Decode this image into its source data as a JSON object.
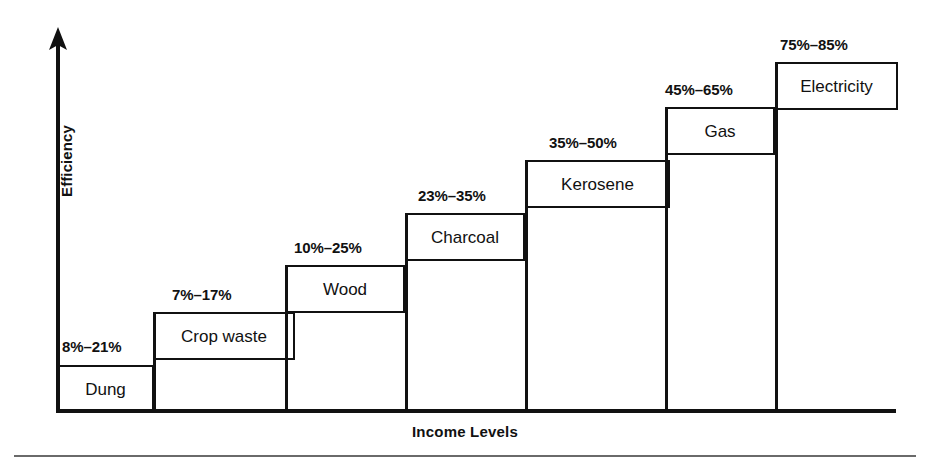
{
  "figure": {
    "y_axis_label": "Efficiency",
    "x_axis_label": "Income Levels"
  },
  "chart_data": {
    "type": "bar",
    "title": "",
    "xlabel": "Income Levels",
    "ylabel": "Efficiency",
    "subtitle": "",
    "grid": false,
    "legend": "none",
    "annotation_format": "low%-high%",
    "categories": [
      "Dung",
      "Crop waste",
      "Wood",
      "Charcoal",
      "Kerosene",
      "Gas",
      "Electricity"
    ],
    "range_labels": [
      "8%–21%",
      "7%–17%",
      "10%–25%",
      "23%–35%",
      "35%–50%",
      "45%–65%",
      "75%–85%"
    ],
    "low_values": [
      8,
      7,
      10,
      23,
      35,
      45,
      75
    ],
    "high_values": [
      21,
      17,
      25,
      35,
      50,
      65,
      85
    ],
    "series": [
      {
        "name": "Efficiency low (%)",
        "values": [
          8,
          7,
          10,
          23,
          35,
          45,
          75
        ]
      },
      {
        "name": "Efficiency high (%)",
        "values": [
          21,
          17,
          25,
          35,
          50,
          65,
          85
        ]
      }
    ],
    "ylim": [
      0,
      100
    ],
    "xlim": null
  },
  "steps": [
    {
      "name": "Dung",
      "range": "8%–21%",
      "box": {
        "left": 57,
        "top": 365,
        "width": 97,
        "height": 48
      },
      "range_pos": {
        "left": 62,
        "top": 339
      },
      "riser": {
        "left": 57,
        "top": 365,
        "height": 48
      }
    },
    {
      "name": "Crop waste",
      "range": "7%–17%",
      "box": {
        "left": 153,
        "top": 312,
        "width": 142,
        "height": 48
      },
      "range_pos": {
        "left": 172,
        "top": 287
      },
      "riser": {
        "left": 153,
        "top": 312,
        "height": 101
      }
    },
    {
      "name": "Wood",
      "range": "10%–25%",
      "box": {
        "left": 285,
        "top": 265,
        "width": 120,
        "height": 48
      },
      "range_pos": {
        "left": 294,
        "top": 240
      },
      "riser": {
        "left": 285,
        "top": 265,
        "height": 148
      }
    },
    {
      "name": "Charcoal",
      "range": "23%–35%",
      "box": {
        "left": 405,
        "top": 213,
        "width": 120,
        "height": 48
      },
      "range_pos": {
        "left": 418,
        "top": 188
      },
      "riser": {
        "left": 405,
        "top": 213,
        "height": 200
      }
    },
    {
      "name": "Kerosene",
      "range": "35%–50%",
      "box": {
        "left": 525,
        "top": 160,
        "width": 145,
        "height": 48
      },
      "range_pos": {
        "left": 549,
        "top": 135
      },
      "riser": {
        "left": 525,
        "top": 160,
        "height": 253
      }
    },
    {
      "name": "Gas",
      "range": "45%–65%",
      "box": {
        "left": 665,
        "top": 107,
        "width": 110,
        "height": 48
      },
      "range_pos": {
        "left": 665,
        "top": 82
      },
      "riser": {
        "left": 665,
        "top": 107,
        "height": 306
      }
    },
    {
      "name": "Electricity",
      "range": "75%–85%",
      "box": {
        "left": 775,
        "top": 62,
        "width": 123,
        "height": 48
      },
      "range_pos": {
        "left": 780,
        "top": 37
      },
      "riser": {
        "left": 775,
        "top": 62,
        "height": 351
      }
    }
  ]
}
